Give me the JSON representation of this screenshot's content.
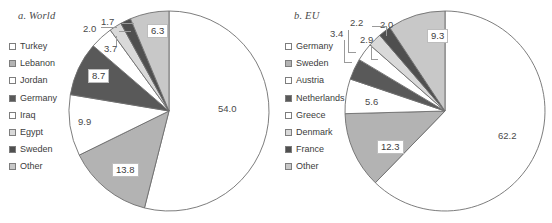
{
  "figure": {
    "width": 552,
    "height": 223,
    "background": "#ffffff"
  },
  "chart_data": [
    {
      "type": "pie",
      "title": "a. World",
      "panel_id": "world",
      "categories": [
        "Turkey",
        "Lebanon",
        "Jordan",
        "Germany",
        "Iraq",
        "Egypt",
        "Sweden",
        "Other"
      ],
      "values": [
        54.0,
        13.8,
        9.9,
        8.7,
        3.7,
        2.0,
        1.7,
        6.3
      ],
      "labels": [
        "54.0",
        "13.8",
        "9.9",
        "8.7",
        "3.7",
        "2.0",
        "1.7",
        "6.3"
      ],
      "colors": [
        "#ffffff",
        "#b3b3b3",
        "#ffffff",
        "#595959",
        "#ffffff",
        "#d9d9d9",
        "#4f4f4f",
        "#c8c8c8"
      ],
      "legend_position": "left",
      "units": "percent",
      "start_angle_deg": 0,
      "direction": "clockwise"
    },
    {
      "type": "pie",
      "title": "b. EU",
      "panel_id": "eu",
      "categories": [
        "Germany",
        "Sweden",
        "Austria",
        "Netherlands",
        "Greece",
        "Denmark",
        "France",
        "Other"
      ],
      "values": [
        62.2,
        12.3,
        5.6,
        3.4,
        2.9,
        2.2,
        2.0,
        9.3
      ],
      "labels": [
        "62.2",
        "12.3",
        "5.6",
        "3.4",
        "2.9",
        "2.2",
        "2.0",
        "9.3"
      ],
      "colors": [
        "#ffffff",
        "#b3b3b3",
        "#ffffff",
        "#595959",
        "#ffffff",
        "#d9d9d9",
        "#4f4f4f",
        "#c8c8c8"
      ],
      "legend_position": "left",
      "units": "percent",
      "start_angle_deg": 0,
      "direction": "clockwise"
    }
  ],
  "world": {
    "title": "a. World",
    "legend": [
      {
        "label": "Turkey",
        "color": "#ffffff"
      },
      {
        "label": "Lebanon",
        "color": "#b3b3b3"
      },
      {
        "label": "Jordan",
        "color": "#ffffff"
      },
      {
        "label": "Germany",
        "color": "#595959"
      },
      {
        "label": "Iraq",
        "color": "#ffffff"
      },
      {
        "label": "Egypt",
        "color": "#d9d9d9"
      },
      {
        "label": "Sweden",
        "color": "#4f4f4f"
      },
      {
        "label": "Other",
        "color": "#c8c8c8"
      }
    ],
    "value_labels": [
      {
        "text": "54.0",
        "boxed": false
      },
      {
        "text": "13.8",
        "boxed": true
      },
      {
        "text": "9.9",
        "boxed": false
      },
      {
        "text": "8.7",
        "boxed": true
      },
      {
        "text": "3.7",
        "boxed": false
      },
      {
        "text": "2.0",
        "boxed": false
      },
      {
        "text": "1.7",
        "boxed": false
      },
      {
        "text": "6.3",
        "boxed": true
      }
    ]
  },
  "eu": {
    "title": "b. EU",
    "legend": [
      {
        "label": "Germany",
        "color": "#ffffff"
      },
      {
        "label": "Sweden",
        "color": "#b3b3b3"
      },
      {
        "label": "Austria",
        "color": "#ffffff"
      },
      {
        "label": "Netherlands",
        "color": "#595959"
      },
      {
        "label": "Greece",
        "color": "#ffffff"
      },
      {
        "label": "Denmark",
        "color": "#d9d9d9"
      },
      {
        "label": "France",
        "color": "#4f4f4f"
      },
      {
        "label": "Other",
        "color": "#c8c8c8"
      }
    ],
    "value_labels": [
      {
        "text": "62.2",
        "boxed": false
      },
      {
        "text": "12.3",
        "boxed": true
      },
      {
        "text": "5.6",
        "boxed": false
      },
      {
        "text": "3.4",
        "boxed": false
      },
      {
        "text": "2.9",
        "boxed": false
      },
      {
        "text": "2.2",
        "boxed": false
      },
      {
        "text": "2.0",
        "boxed": false
      },
      {
        "text": "9.3",
        "boxed": true
      }
    ]
  }
}
